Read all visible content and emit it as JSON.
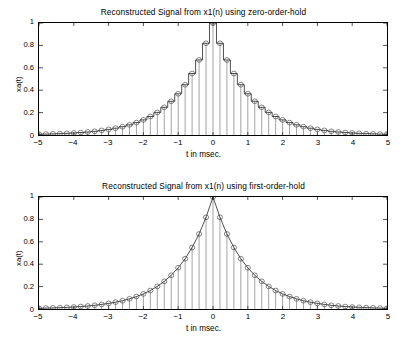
{
  "figure": {
    "background": "#ffffff",
    "line_color": "#000000",
    "marker_color": "#000000"
  },
  "subplots": [
    {
      "id": "zero-order-hold",
      "title": "Reconstructed Signal from x1(n) using zero-order-hold",
      "xlabel": "t in msec.",
      "ylabel": "xa(t)",
      "xticks": [
        "-5",
        "-4",
        "-3",
        "-2",
        "-1",
        "0",
        "1",
        "2",
        "3",
        "4",
        "5"
      ],
      "yticks": [
        "0",
        "0.2",
        "0.4",
        "0.6",
        "0.8",
        "1"
      ]
    },
    {
      "id": "first-order-hold",
      "title": "Reconstructed Signal from x1(n) using first-order-hold",
      "xlabel": "t in msec.",
      "ylabel": "xa(t)",
      "xticks": [
        "-5",
        "-4",
        "-3",
        "-2",
        "-1",
        "0",
        "1",
        "2",
        "3",
        "4",
        "5"
      ],
      "yticks": [
        "0",
        "0.2",
        "0.4",
        "0.6",
        "0.8",
        "1"
      ]
    }
  ],
  "chart_data": [
    {
      "type": "line",
      "title": "Reconstructed Signal from x1(n) using zero-order-hold",
      "xlabel": "t in msec.",
      "ylabel": "xa(t)",
      "xlim": [
        -5,
        5
      ],
      "ylim": [
        0,
        1
      ],
      "xticks": [
        -5,
        -4,
        -3,
        -2,
        -1,
        0,
        1,
        2,
        3,
        4,
        5
      ],
      "yticks": [
        0,
        0.2,
        0.4,
        0.6,
        0.8,
        1
      ],
      "grid": false,
      "legend": null,
      "interpolation": "zero-order-hold",
      "sample_interval_ms": 0.2,
      "marker": "o",
      "series": [
        {
          "name": "x1(n) samples",
          "x": [
            -5,
            -4.8,
            -4.6,
            -4.4,
            -4.2,
            -4,
            -3.8,
            -3.6,
            -3.4,
            -3.2,
            -3,
            -2.8,
            -2.6,
            -2.4,
            -2.2,
            -2,
            -1.8,
            -1.6,
            -1.4,
            -1.2,
            -1,
            -0.8,
            -0.6,
            -0.4,
            -0.2,
            0,
            0.2,
            0.4,
            0.6,
            0.8,
            1,
            1.2,
            1.4,
            1.6,
            1.8,
            2,
            2.2,
            2.4,
            2.6,
            2.8,
            3,
            3.2,
            3.4,
            3.6,
            3.8,
            4,
            4.2,
            4.4,
            4.6,
            4.8,
            5
          ],
          "values": [
            0.007,
            0.008,
            0.01,
            0.012,
            0.015,
            0.018,
            0.022,
            0.027,
            0.033,
            0.041,
            0.05,
            0.061,
            0.074,
            0.091,
            0.111,
            0.135,
            0.165,
            0.202,
            0.247,
            0.301,
            0.368,
            0.449,
            0.549,
            0.67,
            0.819,
            1.0,
            0.819,
            0.67,
            0.549,
            0.449,
            0.368,
            0.301,
            0.247,
            0.202,
            0.165,
            0.135,
            0.111,
            0.091,
            0.074,
            0.061,
            0.05,
            0.041,
            0.033,
            0.027,
            0.022,
            0.018,
            0.015,
            0.012,
            0.01,
            0.008,
            0.007
          ]
        }
      ]
    },
    {
      "type": "line",
      "title": "Reconstructed Signal from x1(n) using first-order-hold",
      "xlabel": "t in msec.",
      "ylabel": "xa(t)",
      "xlim": [
        -5,
        5
      ],
      "ylim": [
        0,
        1
      ],
      "xticks": [
        -5,
        -4,
        -3,
        -2,
        -1,
        0,
        1,
        2,
        3,
        4,
        5
      ],
      "yticks": [
        0,
        0.2,
        0.4,
        0.6,
        0.8,
        1
      ],
      "grid": false,
      "legend": null,
      "interpolation": "first-order-hold",
      "sample_interval_ms": 0.2,
      "marker": "o",
      "series": [
        {
          "name": "x1(n) samples",
          "x": [
            -5,
            -4.8,
            -4.6,
            -4.4,
            -4.2,
            -4,
            -3.8,
            -3.6,
            -3.4,
            -3.2,
            -3,
            -2.8,
            -2.6,
            -2.4,
            -2.2,
            -2,
            -1.8,
            -1.6,
            -1.4,
            -1.2,
            -1,
            -0.8,
            -0.6,
            -0.4,
            -0.2,
            0,
            0.2,
            0.4,
            0.6,
            0.8,
            1,
            1.2,
            1.4,
            1.6,
            1.8,
            2,
            2.2,
            2.4,
            2.6,
            2.8,
            3,
            3.2,
            3.4,
            3.6,
            3.8,
            4,
            4.2,
            4.4,
            4.6,
            4.8,
            5
          ],
          "values": [
            0.007,
            0.008,
            0.01,
            0.012,
            0.015,
            0.018,
            0.022,
            0.027,
            0.033,
            0.041,
            0.05,
            0.061,
            0.074,
            0.091,
            0.111,
            0.135,
            0.165,
            0.202,
            0.247,
            0.301,
            0.368,
            0.449,
            0.549,
            0.67,
            0.819,
            1.0,
            0.819,
            0.67,
            0.549,
            0.449,
            0.368,
            0.301,
            0.247,
            0.202,
            0.165,
            0.135,
            0.111,
            0.091,
            0.074,
            0.061,
            0.05,
            0.041,
            0.033,
            0.027,
            0.022,
            0.018,
            0.015,
            0.012,
            0.01,
            0.008,
            0.007
          ]
        }
      ]
    }
  ]
}
